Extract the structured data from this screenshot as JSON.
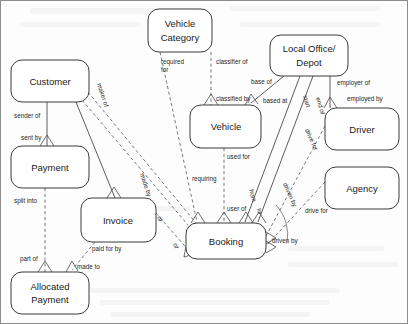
{
  "diagram": {
    "type": "entity-relationship-diagram",
    "colors": {
      "entity_fill": "#ffffff",
      "entity_stroke": "#3a3a3a",
      "solid_line": "#4a4a4a",
      "dashed_line": "#6a6a6a",
      "text": "#1a1a1a",
      "background": "#fdfdfd"
    },
    "entities": [
      {
        "id": "customer",
        "label": "Customer",
        "lines": [
          "Customer"
        ],
        "x": 11,
        "y": 60,
        "w": 78,
        "h": 42
      },
      {
        "id": "payment",
        "label": "Payment",
        "lines": [
          "Payment"
        ],
        "x": 11,
        "y": 146,
        "w": 78,
        "h": 42
      },
      {
        "id": "allocated_payment",
        "label": "Allocated Payment",
        "lines": [
          "Allocated",
          "Payment"
        ],
        "x": 11,
        "y": 272,
        "w": 78,
        "h": 42
      },
      {
        "id": "invoice",
        "label": "Invoice",
        "lines": [
          "Invoice"
        ],
        "x": 81,
        "y": 198,
        "w": 75,
        "h": 44
      },
      {
        "id": "vehicle_category",
        "label": "Vehicle Category",
        "lines": [
          "Vehicle",
          "Category"
        ],
        "x": 148,
        "y": 9,
        "w": 64,
        "h": 43
      },
      {
        "id": "vehicle",
        "label": "Vehicle",
        "lines": [
          "Vehicle"
        ],
        "x": 190,
        "y": 105,
        "w": 71,
        "h": 43
      },
      {
        "id": "booking",
        "label": "Booking",
        "lines": [
          "Booking"
        ],
        "x": 186,
        "y": 223,
        "w": 80,
        "h": 36
      },
      {
        "id": "local_office",
        "label": "Local Office/ Depot",
        "lines": [
          "Local Office/",
          "Depot"
        ],
        "x": 270,
        "y": 35,
        "w": 78,
        "h": 41
      },
      {
        "id": "driver",
        "label": "Driver",
        "lines": [
          "Driver"
        ],
        "x": 325,
        "y": 108,
        "w": 74,
        "h": 42
      },
      {
        "id": "agency",
        "label": "Agency",
        "lines": [
          "Agency"
        ],
        "x": 325,
        "y": 167,
        "w": 74,
        "h": 42
      }
    ],
    "relationships": [
      {
        "id": "customer-payment-sender",
        "from": "customer",
        "to": "payment",
        "label_from": "sender of",
        "label_to": "sent by",
        "style": "solid"
      },
      {
        "id": "customer-booking-maker",
        "from": "customer",
        "to": "booking",
        "label_from": "maker of",
        "label_to": "made by",
        "style": "dashed"
      },
      {
        "id": "customer-invoice",
        "from": "customer",
        "to": "invoice",
        "label_from": "",
        "label_to": "",
        "style": "solid"
      },
      {
        "id": "payment-allocated-split",
        "from": "payment",
        "to": "allocated",
        "label_from": "split into",
        "label_to": "part of",
        "style": "dashed"
      },
      {
        "id": "invoice-allocated-paid",
        "from": "invoice",
        "to": "allocated",
        "label_from": "paid for by",
        "label_to": "made to",
        "style": "dashed"
      },
      {
        "id": "invoice-booking-of",
        "from": "invoice",
        "to": "booking",
        "label_from": "of",
        "label_to": "of",
        "style": "dashed"
      },
      {
        "id": "vc-booking-required",
        "from": "vehicle_category",
        "to": "booking",
        "label_from": "required for",
        "label_to": "requiring",
        "style": "dashed"
      },
      {
        "id": "vc-vehicle-classifier",
        "from": "vehicle_category",
        "to": "vehicle",
        "label_from": "classifier of",
        "label_to": "classified by",
        "style": "dashed"
      },
      {
        "id": "vehicle-booking-used",
        "from": "vehicle",
        "to": "booking",
        "label_from": "used for",
        "label_to": "user of",
        "style": "dashed"
      },
      {
        "id": "office-vehicle-base",
        "from": "local_office",
        "to": "vehicle",
        "label_from": "base of",
        "label_to": "based at",
        "style": "solid"
      },
      {
        "id": "office-booking-start",
        "from": "local_office",
        "to": "booking",
        "label_from": "start",
        "label_to": "from",
        "style": "solid"
      },
      {
        "id": "office-booking-end",
        "from": "local_office",
        "to": "booking",
        "label_from": "end of",
        "label_to": "to",
        "style": "solid"
      },
      {
        "id": "office-driver-employer",
        "from": "local_office",
        "to": "driver",
        "label_from": "employer of",
        "label_to": "employed by",
        "style": "solid"
      },
      {
        "id": "driver-booking-drives",
        "from": "driver",
        "to": "booking",
        "label_from": "drive for",
        "label_to": "driven by",
        "style": "dashed"
      },
      {
        "id": "agency-booking-drives",
        "from": "agency",
        "to": "booking",
        "label_from": "drive for",
        "label_to": "driven by",
        "style": "dashed"
      }
    ],
    "edge_labels": [
      {
        "id": "lbl-sender-of",
        "text": "sender of",
        "x": 14,
        "y": 118,
        "rotate": 0
      },
      {
        "id": "lbl-sent-by",
        "text": "sent by",
        "x": 21,
        "y": 140,
        "rotate": 0
      },
      {
        "id": "lbl-maker-of",
        "text": "maker of",
        "x": 97,
        "y": 84,
        "rotate": 72
      },
      {
        "id": "lbl-made-by",
        "text": "made by",
        "x": 140,
        "y": 174,
        "rotate": 72
      },
      {
        "id": "lbl-split-into",
        "text": "split into",
        "x": 14,
        "y": 203,
        "rotate": 0
      },
      {
        "id": "lbl-part-of",
        "text": "part of",
        "x": 20,
        "y": 261,
        "rotate": 0
      },
      {
        "id": "lbl-paid-for-by",
        "text": "paid for by",
        "x": 92,
        "y": 251,
        "rotate": 0
      },
      {
        "id": "lbl-made-to",
        "text": "made to",
        "x": 77,
        "y": 269,
        "rotate": 0
      },
      {
        "id": "lbl-of-invoice",
        "text": "of",
        "x": 157,
        "y": 217,
        "rotate": 72
      },
      {
        "id": "lbl-of-booking",
        "text": "of",
        "x": 173,
        "y": 244,
        "rotate": 72
      },
      {
        "id": "lbl-required-for1",
        "text": "required",
        "x": 161,
        "y": 64,
        "rotate": 0
      },
      {
        "id": "lbl-required-for2",
        "text": "for",
        "x": 161,
        "y": 72,
        "rotate": 0
      },
      {
        "id": "lbl-requiring",
        "text": "requiring",
        "x": 192,
        "y": 181,
        "rotate": 0
      },
      {
        "id": "lbl-classifier-of",
        "text": "classifier of",
        "x": 216,
        "y": 64,
        "rotate": 0
      },
      {
        "id": "lbl-classified-by",
        "text": "classified by",
        "x": 216,
        "y": 101,
        "rotate": 0
      },
      {
        "id": "lbl-used-for",
        "text": "used for",
        "x": 227,
        "y": 159,
        "rotate": 0
      },
      {
        "id": "lbl-user-of",
        "text": "user of",
        "x": 227,
        "y": 211,
        "rotate": 0
      },
      {
        "id": "lbl-base-of",
        "text": "base of",
        "x": 251,
        "y": 84,
        "rotate": 0
      },
      {
        "id": "lbl-based-at",
        "text": "based at",
        "x": 263,
        "y": 103,
        "rotate": 0
      },
      {
        "id": "lbl-start",
        "text": "start",
        "x": 303,
        "y": 96,
        "rotate": 74
      },
      {
        "id": "lbl-from",
        "text": "from",
        "x": 249,
        "y": 190,
        "rotate": 74
      },
      {
        "id": "lbl-end-of",
        "text": "end of",
        "x": 316,
        "y": 98,
        "rotate": 74
      },
      {
        "id": "lbl-to",
        "text": "to",
        "x": 257,
        "y": 209,
        "rotate": 74
      },
      {
        "id": "lbl-employer-of",
        "text": "employer of",
        "x": 337,
        "y": 85,
        "rotate": 0
      },
      {
        "id": "lbl-employed-by",
        "text": "employed by",
        "x": 347,
        "y": 101,
        "rotate": 0
      },
      {
        "id": "lbl-drive-for-d",
        "text": "drive for",
        "x": 305,
        "y": 130,
        "rotate": 66
      },
      {
        "id": "lbl-driven-by-d",
        "text": "driven by",
        "x": 283,
        "y": 184,
        "rotate": 66
      },
      {
        "id": "lbl-drive-for-a",
        "text": "drive for",
        "x": 305,
        "y": 213,
        "rotate": 0
      },
      {
        "id": "lbl-driven-by-a",
        "text": "driven by",
        "x": 272,
        "y": 243,
        "rotate": 0
      }
    ]
  }
}
